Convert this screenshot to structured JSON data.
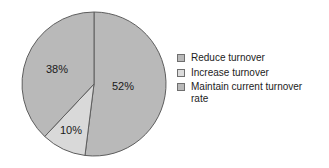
{
  "chart_data": {
    "type": "pie",
    "title": "",
    "categories": [
      "Reduce turnover",
      "Increase turnover",
      "Maintain current turnover rate"
    ],
    "values": [
      52,
      10,
      38
    ],
    "value_labels": [
      "52%",
      "10%",
      "38%"
    ],
    "colors": [
      "#b9b9b9",
      "#d9d9d9",
      "#b9b9b9"
    ],
    "legend_position": "right",
    "grid": false,
    "xlabel": "",
    "ylabel": "",
    "slices": [
      {
        "label": "Reduce turnover",
        "value": 52,
        "value_label": "52%",
        "color": "#b9b9b9",
        "start_angle": 0,
        "end_angle": 187.2,
        "label_x": 123,
        "label_y": 87
      },
      {
        "label": "Increase turnover",
        "value": 10,
        "value_label": "10%",
        "color": "#d9d9d9",
        "start_angle": 187.2,
        "end_angle": 223.2,
        "label_x": 71,
        "label_y": 131
      },
      {
        "label": "Maintain current turnover rate",
        "value": 38,
        "value_label": "38%",
        "color": "#b9b9b9",
        "start_angle": 223.2,
        "end_angle": 360,
        "label_x": 57,
        "label_y": 70
      }
    ]
  },
  "legend": {
    "items": [
      {
        "label": "Reduce turnover",
        "color": "#b9b9b9"
      },
      {
        "label": "Increase turnover",
        "color": "#dcdcdc"
      },
      {
        "label": "Maintain current turnover\nrate",
        "color": "#b9b9b9"
      }
    ]
  },
  "geometry": {
    "center_x": 94,
    "center_y": 84,
    "radius": 72,
    "outline_color": "#5e5e5e"
  }
}
